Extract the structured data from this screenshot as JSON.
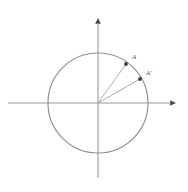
{
  "figure": {
    "kind": "unit-circle-diagram",
    "background_color": "#ffffff",
    "width": 188,
    "height": 192
  },
  "colors": {
    "axis": "#9a9a9a",
    "axis_arrow": "#4a4a4a",
    "circle": "#8e8e8e",
    "radius": "#9e9e9e",
    "point": "#3d3d3d",
    "label": "#5c5c5c"
  },
  "origin": {
    "x": 98,
    "y": 103
  },
  "circle": {
    "center_x": 98,
    "center_y": 103,
    "radius": 50
  },
  "axes": {
    "horizontal": {
      "x1": 8,
      "y1": 103,
      "x2": 170,
      "y2": 103,
      "arrow": {
        "x": 176,
        "y": 103,
        "size": 3.2
      }
    },
    "vertical": {
      "x1": 98,
      "y1": 24,
      "x2": 98,
      "y2": 178,
      "arrow": {
        "x": 98,
        "y": 18,
        "size": 3.2
      }
    }
  },
  "points": [
    {
      "id": "A",
      "label": "A",
      "x": 126,
      "y": 64,
      "marker_size": 1.9,
      "label_x": 132,
      "label_y": 59
    },
    {
      "id": "A-prime",
      "label": "A'",
      "x": 140,
      "y": 79,
      "marker_size": 1.9,
      "label_x": 146,
      "label_y": 75
    }
  ],
  "radii": [
    {
      "id": "radius-to-A",
      "x1": 98,
      "y1": 103,
      "x2": 126,
      "y2": 64
    },
    {
      "id": "radius-to-A-prime",
      "x1": 98,
      "y1": 103,
      "x2": 140,
      "y2": 79
    }
  ]
}
